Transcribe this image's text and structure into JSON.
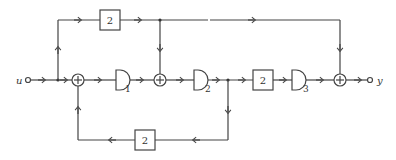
{
  "diagram": {
    "type": "block-diagram",
    "input_label": "u",
    "output_label": "y",
    "gain_blocks": [
      {
        "id": "gain-top",
        "value": "2"
      },
      {
        "id": "gain-main",
        "value": "2"
      },
      {
        "id": "gain-feedback",
        "value": "2"
      }
    ],
    "delay_blocks": [
      {
        "id": "D1",
        "label": "D",
        "subscript": "1"
      },
      {
        "id": "D2",
        "label": "D",
        "subscript": "2"
      },
      {
        "id": "D3",
        "label": "D",
        "subscript": "3"
      }
    ],
    "summers": [
      {
        "id": "sum1",
        "symbol": "+"
      },
      {
        "id": "sum2",
        "symbol": "+"
      },
      {
        "id": "sum3",
        "symbol": "+"
      }
    ]
  }
}
